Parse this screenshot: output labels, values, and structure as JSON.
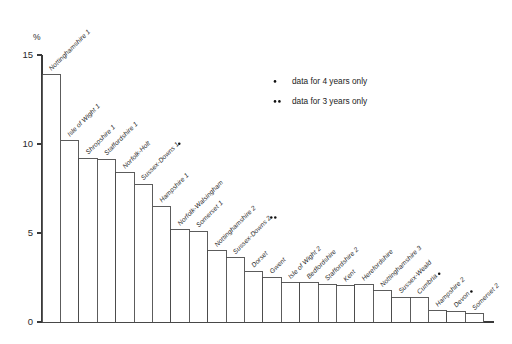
{
  "chart_data": {
    "type": "bar",
    "title": "",
    "subtitle": "",
    "xlabel": "",
    "ylabel": "%",
    "ylim": [
      0,
      15
    ],
    "yticks": [
      0,
      5,
      10,
      15
    ],
    "ytick_labels": [
      "0",
      "5",
      "10",
      "15"
    ],
    "grid": false,
    "legend_position": "upper-right",
    "categories": [
      "Nottinghamshire 1",
      "Isle of Wight 1",
      "Shropshire 1",
      "Staffordshire 1",
      "Norfolk-Holt",
      "Sussex-Downs 1",
      "Hampshire 1",
      "Norfolk-Walsingham",
      "Somerset 1",
      "Nottinghamshire 2",
      "Sussex-Downs 2",
      "Dorset",
      "Gwent",
      "Isle of Wight 2",
      "Bedfordshire",
      "Staffordshire 2",
      "Kent",
      "Herefordshire",
      "Nottinghamshire 3",
      "Sussex-Weald",
      "Cumbria",
      "Hampshire 2",
      "Devon",
      "Somerset 2"
    ],
    "values": [
      13.9,
      10.2,
      9.2,
      9.15,
      8.4,
      7.75,
      6.5,
      5.2,
      5.1,
      4.0,
      3.6,
      2.85,
      2.5,
      2.2,
      2.2,
      2.1,
      2.05,
      2.1,
      1.75,
      1.4,
      1.35,
      0.65,
      0.6,
      0.45
    ],
    "markers": [
      "",
      "",
      "",
      "",
      "",
      "•",
      "",
      "",
      "",
      "",
      "••",
      "",
      "",
      "",
      "",
      "",
      "",
      "",
      "",
      "",
      "•",
      "",
      "•",
      ""
    ],
    "label_suffixes": [
      "Nottinghamshire 1",
      "Isle of Wight 1",
      "Shropshire 1",
      "Staffordshire 1",
      "Norfolk-Holt",
      "Sussex-Downs 1",
      "Hampshire 1",
      "Norfolk-Walsingham",
      "Somerset 1",
      "Nottinghamshire 2",
      "Sussex-Downs 2",
      "Dorset",
      "Gwent",
      "Isle of Wight 2",
      "Bedfordshire",
      "Staffordshire 2",
      "Kent",
      "Herefordshire",
      "Nottinghamshire 3",
      "Sussex-Weald",
      "Cumbria",
      "Hampshire 2",
      "Devon",
      "Somerset 2"
    ]
  },
  "legend": {
    "entries": [
      {
        "symbol": "•",
        "dots": 1,
        "label": "data for 4 years only"
      },
      {
        "symbol": "••",
        "dots": 2,
        "label": "data for 3 years only"
      }
    ]
  },
  "colors": {
    "bar_fill": "#ffffff",
    "bar_stroke": "#4a4a4a",
    "axis": "#3a3a3a",
    "text": "#222222",
    "background": "#ffffff"
  }
}
